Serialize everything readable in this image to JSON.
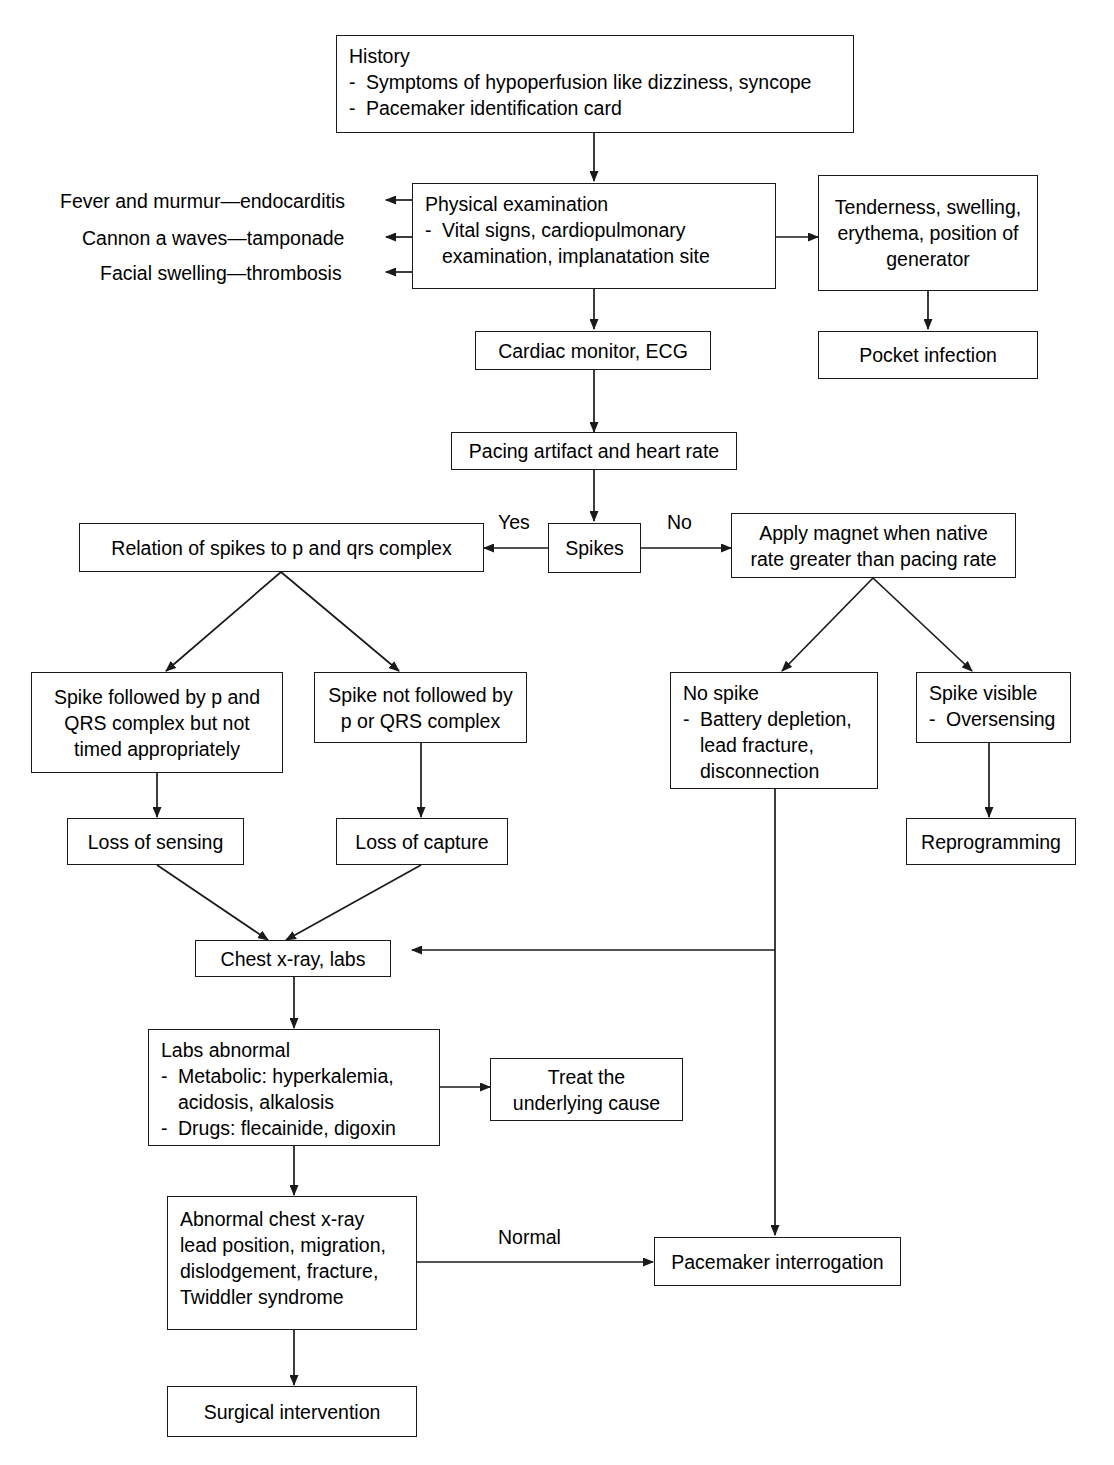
{
  "diagram": {
    "stroke_color": "#1a1a1a",
    "background_color": "#ffffff"
  },
  "nodes": {
    "history": {
      "title": "History",
      "bullets": [
        "Symptoms of hypoperfusion like dizziness, syncope",
        "Pacemaker identification card"
      ]
    },
    "physical_examination": {
      "title": "Physical examination",
      "bullets": [
        "Vital signs, cardiopulmonary examination, implanatation site"
      ]
    },
    "generator_site": {
      "line1": "Tenderness, swelling,",
      "line2": "erythema, position of",
      "line3": "generator"
    },
    "pocket_infection": {
      "label": "Pocket infection"
    },
    "cardiac_monitor": {
      "label": "Cardiac monitor, ECG"
    },
    "pacing_artifact": {
      "label": "Pacing artifact and heart rate"
    },
    "spikes": {
      "label": "Spikes"
    },
    "relation_of_spikes": {
      "label": "Relation of spikes to p and qrs complex"
    },
    "apply_magnet": {
      "line1": "Apply magnet when native",
      "line2": "rate greater than pacing rate"
    },
    "spike_followed": {
      "line1": "Spike followed by p and",
      "line2": "QRS complex but not",
      "line3": "timed appropriately"
    },
    "spike_not_followed": {
      "line1": "Spike not followed by",
      "line2": "p or QRS complex"
    },
    "no_spike": {
      "title": "No spike",
      "bullets": [
        "Battery depletion, lead fracture, disconnection"
      ]
    },
    "spike_visible": {
      "title": "Spike visible",
      "bullets": [
        "Oversensing"
      ]
    },
    "loss_of_sensing": {
      "label": "Loss of sensing"
    },
    "loss_of_capture": {
      "label": "Loss of capture"
    },
    "reprogramming": {
      "label": "Reprogramming"
    },
    "chest_xray_labs": {
      "label": "Chest x-ray, labs"
    },
    "labs_abnormal": {
      "title": "Labs abnormal",
      "bullets": [
        "Metabolic: hyperkalemia, acidosis, alkalosis",
        "Drugs: flecainide, digoxin"
      ]
    },
    "treat_underlying": {
      "line1": "Treat the",
      "line2": "underlying cause"
    },
    "abnormal_chest_xray": {
      "line1": "Abnormal chest x-ray",
      "line2": "lead position, migration,",
      "line3": "dislodgement, fracture,",
      "line4": "Twiddler syndrome"
    },
    "pacemaker_interrogation": {
      "label": "Pacemaker interrogation"
    },
    "surgical_intervention": {
      "label": "Surgical intervention"
    }
  },
  "side_findings": [
    {
      "text": "Fever and murmur—endocarditis"
    },
    {
      "text": "Cannon a waves—tamponade"
    },
    {
      "text": "Facial swelling—thrombosis"
    }
  ],
  "edge_labels": {
    "yes": "Yes",
    "no": "No",
    "normal": "Normal"
  }
}
